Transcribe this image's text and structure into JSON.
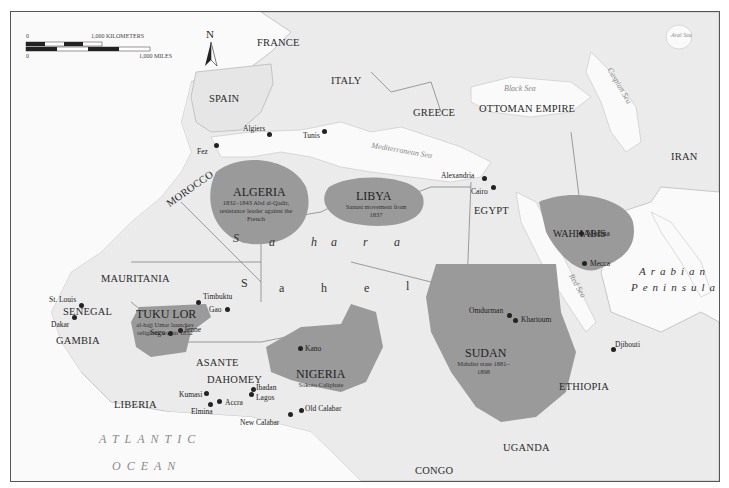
{
  "map": {
    "compass": "N",
    "scale": {
      "km_zero": "0",
      "km_label": "1,000 KILOMETERS",
      "mi_zero": "0",
      "mi_label": "1,000 MILES"
    },
    "countries": {
      "france": "FRANCE",
      "spain": "SPAIN",
      "italy": "ITALY",
      "greece": "GREECE",
      "ottoman": "OTTOMAN EMPIRE",
      "iran": "IRAN",
      "morocco": "MOROCCO",
      "egypt": "EGYPT",
      "mauritania": "MAURITANIA",
      "senegal": "SENEGAL",
      "gambia": "GAMBIA",
      "asante": "ASANTE",
      "dahomey": "DAHOMEY",
      "liberia": "LIBERIA",
      "ethiopia": "ETHIOPIA",
      "uganda": "UGANDA",
      "congo": "CONGO"
    },
    "regions": {
      "algeria": {
        "title": "ALGERIA",
        "sub": "1832–1843 Abd al-Qadir, resistance leader against the French"
      },
      "libya": {
        "title": "LIBYA",
        "sub": "Sanusi movement from 1837"
      },
      "wahhabis": {
        "title": "WAHHABIS"
      },
      "tukulor": {
        "title": "TUKU LOR",
        "sub": "al-hajj Umar launches religious war in 1852"
      },
      "nigeria": {
        "title": "NIGERIA",
        "sub": "Sokoto Caliphate"
      },
      "sudan": {
        "title": "SUDAN",
        "sub": "Mahdist state 1881–1898"
      }
    },
    "seas": {
      "black": "Black Sea",
      "caspian": "Caspian Sea",
      "aral": "Aral Sea",
      "mediterranean": "Mediterranean Sea",
      "red": "Red Sea"
    },
    "features": {
      "sahara": [
        "S",
        "a",
        "h",
        "a",
        "r",
        "a"
      ],
      "sahel": [
        "S",
        "a",
        "h",
        "e",
        "l"
      ],
      "arabian": "Arabian",
      "peninsula": "Peninsula",
      "atlantic": "ATLANTIC",
      "ocean": "OCEAN"
    },
    "cities": {
      "fez": "Fez",
      "algiers": "Algiers",
      "tunis": "Tunis",
      "alexandria": "Alexandria",
      "cairo": "Cairo",
      "medina": "Medina",
      "mecca": "Mecca",
      "st_louis": "St. Louis",
      "dakar": "Dakar",
      "timbuktu": "Timbuktu",
      "gao": "Gao",
      "segu": "Segu",
      "jenne": "Jenne",
      "kano": "Kano",
      "omdurman": "Omdurman",
      "khartoum": "Khartoum",
      "djibouti": "Djibouti",
      "kumasi": "Kumasi",
      "accra": "Accra",
      "elmina": "Elmina",
      "ibadan": "Ibadan",
      "lagos": "Lagos",
      "new_calabar": "New Calabar",
      "old_calabar": "Old Calabar"
    },
    "colors": {
      "shaded_region": "#9a9a9a",
      "land": "#ebebeb",
      "sea": "#fafafa",
      "border": "#777777"
    }
  }
}
